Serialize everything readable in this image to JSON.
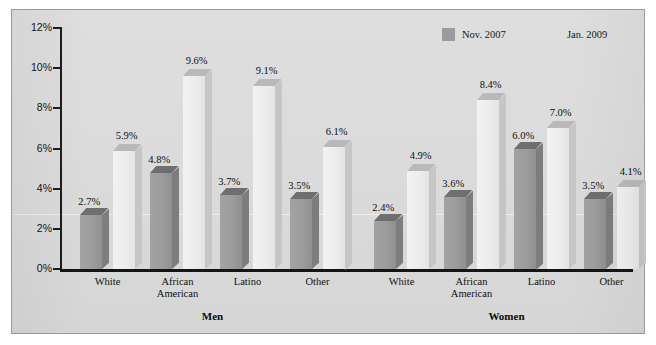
{
  "chart_data": {
    "type": "bar",
    "title": "",
    "xlabel": "",
    "ylabel": "",
    "ylim": [
      0,
      12
    ],
    "ytick_labels": [
      "0%",
      "2%",
      "4%",
      "6%",
      "8%",
      "10%",
      "12%"
    ],
    "ytick_values": [
      0,
      2,
      4,
      6,
      8,
      10,
      12
    ],
    "grid": false,
    "legend_position": "top-right",
    "groups": [
      "Men",
      "Women"
    ],
    "categories": [
      "White",
      "African American",
      "Latino",
      "Other"
    ],
    "series": [
      {
        "name": "Nov. 2007",
        "color": "#9b9b9b",
        "values_men": [
          2.7,
          4.8,
          3.7,
          3.5
        ],
        "values_women": [
          2.4,
          3.6,
          6.0,
          3.5
        ],
        "labels_men": [
          "2.7%",
          "4.8%",
          "3.7%",
          "3.5%"
        ],
        "labels_women": [
          "2.4%",
          "3.6%",
          "6.0%",
          "3.5%"
        ]
      },
      {
        "name": "Jan. 2009",
        "color": "#ececec",
        "values_men": [
          5.9,
          9.6,
          9.1,
          6.1
        ],
        "values_women": [
          4.9,
          8.4,
          7.0,
          4.1
        ],
        "labels_men": [
          "5.9%",
          "9.6%",
          "9.1%",
          "6.1%"
        ],
        "labels_women": [
          "4.9%",
          "8.4%",
          "7.0%",
          "4.1%"
        ]
      }
    ]
  },
  "legend": {
    "items": [
      {
        "label": "Nov. 2007",
        "swatch": "dark"
      },
      {
        "label": "Jan. 2009",
        "swatch": "light"
      }
    ]
  },
  "axis": {
    "y_labels": [
      "12%",
      "10%",
      "8%",
      "6%",
      "4%",
      "2%",
      "0%"
    ]
  },
  "categories": {
    "men": [
      "White",
      "African<br>American",
      "Latino",
      "Other"
    ],
    "women": [
      "White",
      "African<br>American",
      "Latino",
      "Other"
    ]
  },
  "group_labels": {
    "men": "Men",
    "women": "Women"
  },
  "page": {
    "top_bleed_text": ""
  }
}
